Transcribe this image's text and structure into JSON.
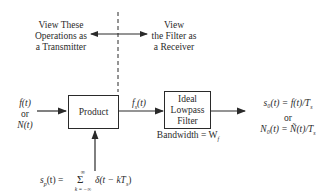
{
  "annotations": {
    "transmitter_view": [
      "View These",
      "Operations as",
      "a Transmitter"
    ],
    "receiver_view": [
      "View",
      "the Filter as",
      "a Receiver"
    ]
  },
  "input": {
    "line1": "f(t)",
    "line2": "or",
    "line3": "N(t)"
  },
  "blocks": {
    "product": {
      "label": "Product"
    },
    "filter": {
      "lines": [
        "Ideal",
        "Lowpass",
        "Filter"
      ],
      "caption": "Bandwidth = W",
      "caption_sub": "f"
    }
  },
  "signals": {
    "intermediate": {
      "base": "f",
      "sub": "s",
      "arg": "(t)"
    },
    "sampling": {
      "lhs": "s",
      "lhs_sub": "p",
      "lhs_arg": "(t) =",
      "sum": "Σ",
      "upper": "∞",
      "lower": "k = −∞",
      "rhs": "δ(t − kT",
      "rhs_sub": "s",
      "rhs_close": ")"
    },
    "output": {
      "line1": "s₀(t) = f(t)/T",
      "line1_sub": "s",
      "line2": "or",
      "line3": "N₀(t) = Ñ(t)/T",
      "line3_sub": "s"
    }
  }
}
